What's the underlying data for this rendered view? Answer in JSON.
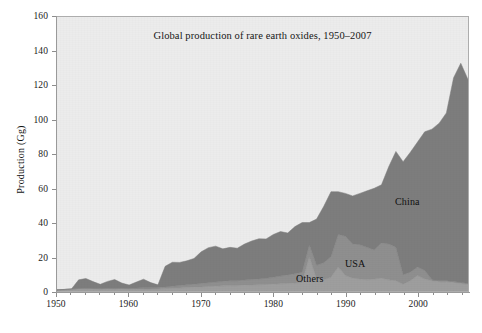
{
  "chart_data": {
    "type": "area",
    "title": "Global production of rare earth oxides, 1950–2007",
    "xlabel": "",
    "ylabel": "Production (Gg)",
    "xlim": [
      1950,
      2007
    ],
    "ylim": [
      0,
      160
    ],
    "grid": false,
    "stacked": true,
    "legend_position": "inline-annotations",
    "xticks": [
      1950,
      1960,
      1970,
      1980,
      1990,
      2000
    ],
    "xtick_labels": [
      "1950",
      "1960",
      "1970",
      "1980",
      "1990",
      "2000"
    ],
    "yticks": [
      0,
      20,
      40,
      60,
      80,
      100,
      120,
      140,
      160
    ],
    "ytick_labels": [
      "0",
      "20",
      "40",
      "60",
      "80",
      "100",
      "120",
      "140",
      "160"
    ],
    "x": [
      1950,
      1951,
      1952,
      1953,
      1954,
      1955,
      1956,
      1957,
      1958,
      1959,
      1960,
      1961,
      1962,
      1963,
      1964,
      1965,
      1966,
      1967,
      1968,
      1969,
      1970,
      1971,
      1972,
      1973,
      1974,
      1975,
      1976,
      1977,
      1978,
      1979,
      1980,
      1981,
      1982,
      1983,
      1984,
      1985,
      1986,
      1987,
      1988,
      1989,
      1990,
      1991,
      1992,
      1993,
      1994,
      1995,
      1996,
      1997,
      1998,
      1999,
      2000,
      2001,
      2002,
      2003,
      2004,
      2005,
      2006,
      2007
    ],
    "series": [
      {
        "name": "Others",
        "color": "#9e9e9e",
        "values": [
          0.5,
          0.6,
          0.8,
          1.0,
          1.2,
          1.0,
          0.9,
          1.0,
          1.1,
          1.0,
          0.9,
          1.0,
          1.1,
          1.1,
          1.2,
          1.4,
          1.6,
          1.8,
          2.0,
          2.2,
          2.4,
          2.6,
          2.8,
          3.0,
          3.2,
          3.2,
          3.4,
          3.5,
          3.6,
          3.8,
          4.0,
          4.2,
          4.4,
          4.6,
          5.0,
          20.0,
          7.0,
          6.5,
          8.0,
          14.0,
          9.0,
          7.5,
          7.0,
          6.5,
          7.0,
          7.5,
          6.5,
          6.0,
          4.0,
          6.0,
          9.0,
          7.0,
          6.0,
          5.5,
          5.5,
          5.0,
          4.5,
          4.0
        ]
      },
      {
        "name": "USA",
        "color": "#8f8f8f",
        "values": [
          0.2,
          0.3,
          0.4,
          0.5,
          0.6,
          0.5,
          0.5,
          0.6,
          0.6,
          0.6,
          0.6,
          0.7,
          0.8,
          0.8,
          0.9,
          1.0,
          1.2,
          1.4,
          1.6,
          1.8,
          2.0,
          2.2,
          2.4,
          2.6,
          2.8,
          2.8,
          3.0,
          3.2,
          3.4,
          3.6,
          4.0,
          4.5,
          5.0,
          5.5,
          6.0,
          7.0,
          8.0,
          10.0,
          12.0,
          19.0,
          23.0,
          20.0,
          20.0,
          19.0,
          17.0,
          20.5,
          21.0,
          19.5,
          5.5,
          5.0,
          5.0,
          5.0,
          0.5,
          0.5,
          0.5,
          0.5,
          0.5,
          0.5
        ]
      },
      {
        "name": "China",
        "color": "#7d7d7d",
        "values": [
          0.0,
          0.0,
          0.0,
          5.0,
          5.5,
          4.0,
          2.5,
          4.0,
          5.0,
          3.0,
          2.0,
          3.5,
          5.0,
          3.0,
          1.5,
          12.0,
          14.0,
          13.5,
          14.0,
          15.0,
          18.5,
          20.5,
          21.0,
          19.0,
          19.5,
          19.0,
          21.0,
          22.5,
          23.5,
          23.0,
          25.0,
          26.0,
          24.5,
          27.5,
          29.0,
          13.0,
          27.0,
          33.0,
          38.0,
          25.0,
          25.0,
          28.0,
          30.0,
          33.0,
          36.0,
          34.0,
          45.0,
          56.0,
          66.0,
          70.0,
          73.0,
          81.0,
          88.0,
          92.0,
          98.0,
          119.0,
          128.0,
          119.0
        ]
      }
    ],
    "totals": [
      0.7,
      0.9,
      1.2,
      6.5,
      7.3,
      5.5,
      3.9,
      5.6,
      6.7,
      4.6,
      3.5,
      5.2,
      6.9,
      4.9,
      3.6,
      14.4,
      16.8,
      16.7,
      17.6,
      19.0,
      22.9,
      25.3,
      26.2,
      24.6,
      25.5,
      25.0,
      27.4,
      29.2,
      30.5,
      30.4,
      33.0,
      34.7,
      33.9,
      37.6,
      40.0,
      40.0,
      42.0,
      49.5,
      58.0,
      58.0,
      57.0,
      55.5,
      57.0,
      58.5,
      60.0,
      62.0,
      72.5,
      81.5,
      75.5,
      81.0,
      87.0,
      93.0,
      94.5,
      98.0,
      104.0,
      124.5,
      133.0,
      123.5
    ]
  },
  "figure": {
    "background_color": "#ffffff",
    "plot_background_color": "#ececec",
    "axis_color": "#9a9a9a",
    "text_color": "#161616"
  }
}
